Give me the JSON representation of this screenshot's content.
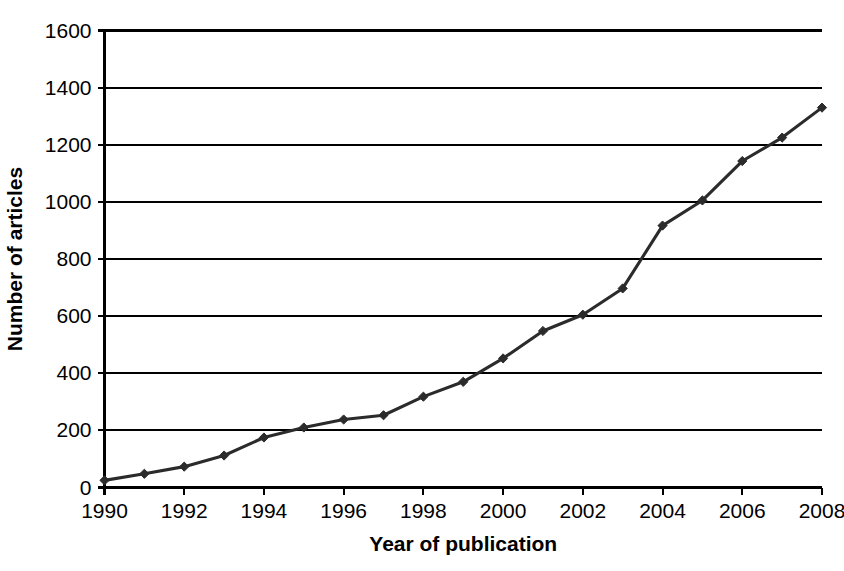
{
  "chart_data": {
    "type": "line",
    "title": "",
    "xlabel": "Year of publication",
    "ylabel": "Number of articles",
    "x": [
      1990,
      1991,
      1992,
      1993,
      1994,
      1995,
      1996,
      1997,
      1998,
      1999,
      2000,
      2001,
      2002,
      2003,
      2004,
      2005,
      2006,
      2007,
      2008
    ],
    "values": [
      25,
      48,
      73,
      112,
      175,
      210,
      238,
      253,
      318,
      370,
      452,
      548,
      605,
      697,
      917,
      1005,
      1143,
      1225,
      1330
    ],
    "series": [
      {
        "name": "Number of articles",
        "values": [
          25,
          48,
          73,
          112,
          175,
          210,
          238,
          253,
          318,
          370,
          452,
          548,
          605,
          697,
          917,
          1005,
          1143,
          1225,
          1330
        ]
      }
    ],
    "xlim": [
      1990,
      2008
    ],
    "ylim": [
      0,
      1600
    ],
    "x_tick_labels": [
      "1990",
      "1992",
      "1994",
      "1996",
      "1998",
      "2000",
      "2002",
      "2004",
      "2006",
      "2008"
    ],
    "x_tick_values": [
      1990,
      1992,
      1994,
      1996,
      1998,
      2000,
      2002,
      2004,
      2006,
      2008
    ],
    "y_tick_labels": [
      "0",
      "200",
      "400",
      "600",
      "800",
      "1000",
      "1200",
      "1400",
      "1600"
    ],
    "y_tick_values": [
      0,
      200,
      400,
      600,
      800,
      1000,
      1200,
      1400,
      1600
    ],
    "grid": "horizontal",
    "legend": "none",
    "marker": "diamond",
    "colors": {
      "line": "#2b2b2b",
      "marker": "#2b2b2b",
      "grid": "#000000",
      "axis": "#000000",
      "background": "#ffffff"
    }
  }
}
